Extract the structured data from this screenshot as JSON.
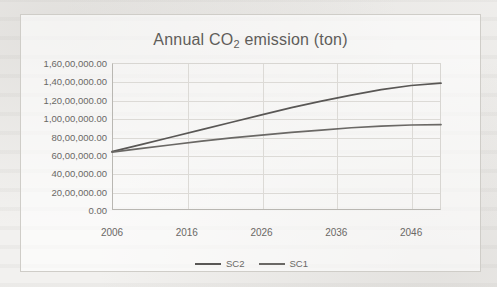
{
  "chart_data": {
    "type": "line",
    "title": "Annual CO2 emission (ton)",
    "title_main": "Annual CO",
    "title_sub": "2",
    "title_tail": " emission (ton)",
    "xlabel": "",
    "ylabel": "",
    "grid": true,
    "legend_position": "bottom",
    "xlim": [
      2006,
      2050
    ],
    "ylim": [
      0,
      16000000
    ],
    "x_ticks": [
      2006,
      2016,
      2026,
      2036,
      2046
    ],
    "x_tick_labels": [
      "2006",
      "2016",
      "2026",
      "2036",
      "2046"
    ],
    "y_ticks": [
      0,
      2000000,
      4000000,
      6000000,
      8000000,
      10000000,
      12000000,
      14000000,
      16000000
    ],
    "y_tick_labels": [
      "0.00",
      "20,00,000.00",
      "40,00,000.00",
      "60,00,000.00",
      "80,00,000.00",
      "1,00,00,000.00",
      "1,20,00,000.00",
      "1,40,00,000.00",
      "1,60,00,000.00"
    ],
    "x": [
      2006,
      2010,
      2014,
      2018,
      2022,
      2026,
      2030,
      2034,
      2038,
      2042,
      2046,
      2050
    ],
    "series": [
      {
        "name": "SC2",
        "color": "#595755",
        "values": [
          6350000,
          7150000,
          7950000,
          8750000,
          9550000,
          10350000,
          11150000,
          11850000,
          12500000,
          13100000,
          13550000,
          13800000
        ]
      },
      {
        "name": "SC1",
        "color": "#6a6865",
        "values": [
          6300000,
          6700000,
          7100000,
          7500000,
          7850000,
          8150000,
          8450000,
          8700000,
          8950000,
          9120000,
          9250000,
          9300000
        ]
      }
    ],
    "legend": [
      "SC2",
      "SC1"
    ]
  },
  "colors": {
    "page_background": "#f2f1ef",
    "frame_border": "#cfcdc8",
    "grid": "#dcdad6",
    "axis": "#b9b7b2",
    "text": "#6a6865",
    "title_text": "#5f5d5a"
  }
}
